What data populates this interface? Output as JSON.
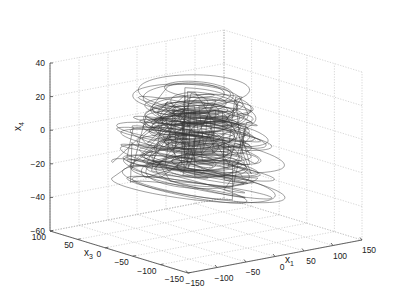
{
  "chart_data": {
    "type": "line3d",
    "title": "",
    "axes": {
      "x": {
        "label": "x",
        "label_sub": "1",
        "ticks": [
          -150,
          -100,
          -50,
          0,
          50,
          100,
          150
        ],
        "range": [
          -150,
          150
        ]
      },
      "y": {
        "label": "x",
        "label_sub": "3",
        "ticks": [
          -150,
          -100,
          -50,
          0,
          50,
          100
        ],
        "range": [
          -150,
          100
        ]
      },
      "z": {
        "label": "x",
        "label_sub": "4",
        "ticks": [
          -60,
          -40,
          -20,
          0,
          20,
          40
        ],
        "range": [
          -60,
          40
        ]
      }
    },
    "grid": true,
    "box": true,
    "line_color": "#333333",
    "grid_color": "#bbbbbb",
    "legend": null
  }
}
